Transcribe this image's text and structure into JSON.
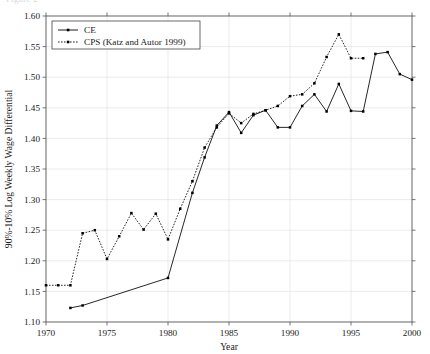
{
  "figure": {
    "top_cut_caption": "Figure 2",
    "background_color": "#ffffff",
    "line_color": "#000000",
    "grid_color": "#e3e3e3",
    "axis_color": "#555555"
  },
  "legend": {
    "position": "top-left",
    "entries": [
      {
        "label": "CE",
        "style": "solid",
        "marker": "dot"
      },
      {
        "label": "CPS (Katz and Autor 1999)",
        "style": "dotted",
        "marker": "dot"
      }
    ]
  },
  "axes": {
    "x": {
      "title": "Year",
      "min": 1970,
      "max": 2000,
      "tick_step": 5,
      "tick_labels": [
        "1970",
        "1975",
        "1980",
        "1985",
        "1990",
        "1995",
        "2000"
      ]
    },
    "y": {
      "title": "90%-10% Log Weekly Wage Differential",
      "min": 1.1,
      "max": 1.6,
      "tick_step": 0.05,
      "tick_labels": [
        "1.10",
        "1.15",
        "1.20",
        "1.25",
        "1.30",
        "1.35",
        "1.40",
        "1.45",
        "1.50",
        "1.55",
        "1.60"
      ]
    }
  },
  "chart_data": {
    "type": "line",
    "title": "",
    "xlabel": "Year",
    "ylabel": "90%-10% Log Weekly Wage Differential",
    "xlim": [
      1970,
      2000
    ],
    "ylim": [
      1.1,
      1.6
    ],
    "grid": true,
    "legend_position": "upper left",
    "series": [
      {
        "name": "CE",
        "style": "solid",
        "marker": "dot",
        "x": [
          1972,
          1973,
          1980,
          1982,
          1983,
          1984,
          1985,
          1986,
          1987,
          1988,
          1989,
          1990,
          1991,
          1992,
          1993,
          1994,
          1995,
          1996,
          1997,
          1998,
          1999,
          2000
        ],
        "y": [
          1.123,
          1.127,
          1.172,
          1.311,
          1.369,
          1.421,
          1.443,
          1.409,
          1.438,
          1.446,
          1.418,
          1.418,
          1.453,
          1.472,
          1.444,
          1.489,
          1.445,
          1.444,
          1.538,
          1.541,
          1.505,
          1.496
        ]
      },
      {
        "name": "CPS (Katz and Autor 1999)",
        "style": "dotted",
        "marker": "dot",
        "x": [
          1970,
          1971,
          1972,
          1973,
          1974,
          1975,
          1976,
          1977,
          1978,
          1979,
          1980,
          1981,
          1982,
          1983,
          1984,
          1985,
          1986,
          1987,
          1988,
          1989,
          1990,
          1991,
          1992,
          1993,
          1994,
          1995,
          1996
        ],
        "y": [
          1.16,
          1.16,
          1.16,
          1.245,
          1.25,
          1.203,
          1.24,
          1.278,
          1.251,
          1.277,
          1.235,
          1.285,
          1.33,
          1.385,
          1.418,
          1.441,
          1.425,
          1.44,
          1.446,
          1.453,
          1.469,
          1.472,
          1.49,
          1.533,
          1.57,
          1.531,
          1.531
        ]
      }
    ]
  }
}
